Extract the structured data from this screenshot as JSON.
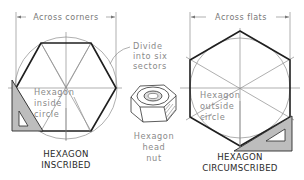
{
  "diagram": {
    "left_figure": {
      "dimension_label": "Across corners",
      "inner_label_lines": [
        "Hexagon",
        "inside",
        "circle"
      ],
      "caption_lines": [
        "HEXAGON",
        "INSCRIBED"
      ]
    },
    "right_figure": {
      "dimension_label": "Across flats",
      "inner_label_lines": [
        "Hexagon",
        "outside",
        "circle"
      ],
      "caption_lines": [
        "HEXAGON",
        "CIRCUMSCRIBED"
      ]
    },
    "callout": {
      "lines": [
        "Divide",
        "into six",
        "sectors"
      ]
    },
    "nut": {
      "label_lines": [
        "Hexagon",
        "head",
        "nut"
      ]
    },
    "colors": {
      "outline": "#1f1f1f",
      "construction": "#8c8c8c",
      "triangle_fill": "#bdbdbd",
      "label_text": "#8a8a8a",
      "caption_text": "#2a2a2a"
    }
  }
}
